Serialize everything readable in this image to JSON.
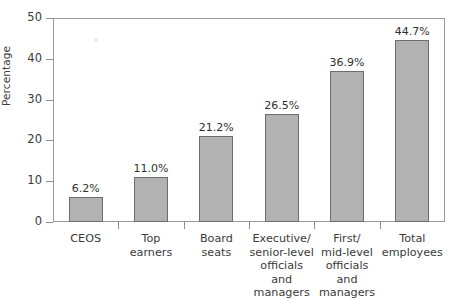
{
  "chart_data": {
    "type": "bar",
    "title": "",
    "subtitle": "",
    "xlabel": "",
    "ylabel": "Percentage",
    "ylim": [
      0,
      50
    ],
    "yticks": [
      0,
      10,
      20,
      30,
      40,
      50
    ],
    "ytick_labels": [
      "0",
      "10",
      "20",
      "30",
      "40",
      "50"
    ],
    "grid": false,
    "legend": null,
    "categories": [
      "CEOS",
      "Top\nearners",
      "Board\nseats",
      "Executive/\nsenior-level\nofficials and\nmanagers",
      "First/\nmid-level\nofficials and\nmanagers",
      "Total\nemployees"
    ],
    "values": [
      6.2,
      11.0,
      21.2,
      26.5,
      36.9,
      44.7
    ],
    "value_labels": [
      "6.2%",
      "11.0%",
      "21.2%",
      "26.5%",
      "36.9%",
      "44.7%"
    ],
    "bar_color": "#b2b2b2",
    "bar_border_color": "#6d6d6d",
    "axis_color": "#9a9a9a",
    "text_color": "#3a3a3a",
    "background": "#ffffff"
  }
}
